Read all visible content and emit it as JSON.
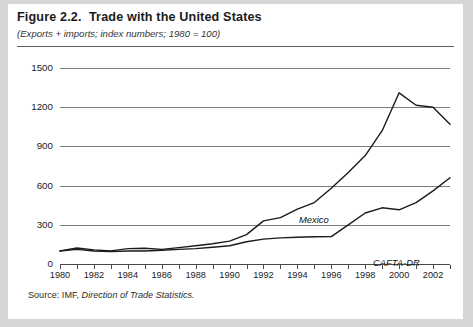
{
  "figure": {
    "title": "Figure 2.2.  Trade with the United States",
    "subtitle": "(Exports + imports; index numbers; 1980 = 100)",
    "source_prefix": "Source: IMF, ",
    "source_italic": "Direction of Trade Statistics."
  },
  "chart_data": {
    "type": "line",
    "title": "Figure 2.2.  Trade with the United States",
    "subtitle": "(Exports + imports; index numbers; 1980 = 100)",
    "xlabel": "",
    "ylabel": "",
    "xlim": [
      1980,
      2003
    ],
    "ylim": [
      0,
      1500
    ],
    "yticks": [
      0,
      300,
      600,
      900,
      1200,
      1500
    ],
    "ytick_labels": [
      "0",
      "300",
      "600",
      "900",
      "1200",
      "1500"
    ],
    "xticks": [
      1980,
      1981,
      1982,
      1983,
      1984,
      1985,
      1986,
      1987,
      1988,
      1989,
      1990,
      1991,
      1992,
      1993,
      1994,
      1995,
      1996,
      1997,
      1998,
      1999,
      2000,
      2001,
      2002,
      2003
    ],
    "xtick_labels": [
      "1980",
      "1982",
      "1984",
      "1986",
      "1988",
      "1990",
      "1992",
      "1994",
      "1996",
      "1998",
      "2000",
      "2002"
    ],
    "xtick_label_years": [
      1980,
      1982,
      1984,
      1986,
      1988,
      1990,
      1992,
      1994,
      1996,
      1998,
      2000,
      2002
    ],
    "grid": true,
    "grid_axis": "y",
    "legend": "inline-labels",
    "line_color": "#1b1b1b",
    "x": [
      1980,
      1981,
      1982,
      1983,
      1984,
      1985,
      1986,
      1987,
      1988,
      1989,
      1990,
      1991,
      1992,
      1993,
      1994,
      1995,
      1996,
      1997,
      1998,
      1999,
      2000,
      2001,
      2002,
      2003
    ],
    "series": [
      {
        "name": "Mexico",
        "label": "Mexico",
        "label_year": 1995,
        "values": [
          100,
          122,
          108,
          100,
          118,
          120,
          112,
          125,
          140,
          155,
          175,
          225,
          330,
          355,
          420,
          470,
          580,
          700,
          830,
          1020,
          1310,
          1215,
          1200,
          1070
        ]
      },
      {
        "name": "CAFTA-DR",
        "label": "CAFTA-DR",
        "label_year": 2000,
        "values": [
          100,
          112,
          100,
          95,
          100,
          100,
          105,
          112,
          118,
          128,
          140,
          170,
          190,
          200,
          205,
          208,
          210,
          300,
          390,
          430,
          415,
          470,
          560,
          660
        ]
      }
    ]
  }
}
